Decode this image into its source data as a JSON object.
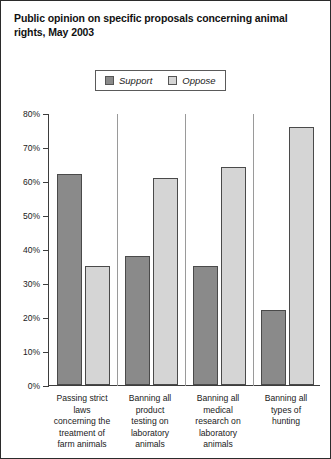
{
  "chart_data": {
    "type": "bar",
    "title": "Public opinion on specific proposals concerning animal rights, May 2003",
    "xlabel": "",
    "ylabel": "",
    "ylim": [
      0,
      80
    ],
    "ytick_values": [
      0,
      10,
      20,
      30,
      40,
      50,
      60,
      70,
      80
    ],
    "ytick_labels": [
      "0%",
      "10%",
      "20%",
      "30%",
      "40%",
      "50%",
      "60%",
      "70%",
      "80%"
    ],
    "grid": false,
    "legend_position": "top-center",
    "categories": [
      "Passing strict laws concerning the treatment of farm animals",
      "Banning all product testing on laboratory animals",
      "Banning all medical research on laboratory animals",
      "Banning all types of hunting"
    ],
    "category_lines": [
      [
        "Passing strict",
        "laws",
        "concerning the",
        "treatment of",
        "farm animals"
      ],
      [
        "Banning all",
        "product",
        "testing on",
        "laboratory",
        "animals"
      ],
      [
        "Banning all",
        "medical",
        "research on",
        "laboratory",
        "animals"
      ],
      [
        "Banning all",
        "types of",
        "hunting"
      ]
    ],
    "series": [
      {
        "name": "Support",
        "color": "#8a8a8a",
        "values": [
          62,
          38,
          35,
          22
        ]
      },
      {
        "name": "Oppose",
        "color": "#d5d5d5",
        "values": [
          35,
          61,
          64,
          76
        ]
      }
    ]
  },
  "legend": {
    "entries": [
      {
        "label": "Support",
        "color": "#8a8a8a"
      },
      {
        "label": "Oppose",
        "color": "#d5d5d5"
      }
    ]
  },
  "colors": {
    "support": "#8a8a8a",
    "oppose": "#d5d5d5",
    "bar_border": "#4a4a4a",
    "axis": "#3d3d3d",
    "frame": "#2b2b2b",
    "background": "#ffffff",
    "text": "#1a1a1a"
  }
}
